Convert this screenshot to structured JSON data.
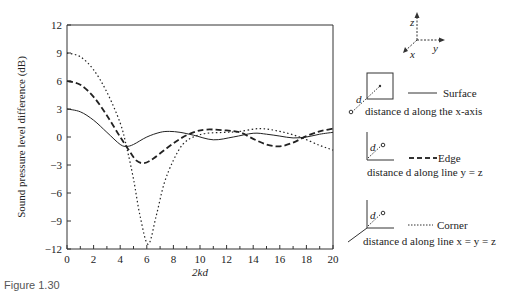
{
  "caption": "Figure 1.30",
  "axes": {
    "ylabel": "Sound pressure level difference (dB)",
    "xlabel": "2kd",
    "yticks": [
      "12",
      "9",
      "6",
      "3",
      "0",
      "−3",
      "−6",
      "−9",
      "−12"
    ],
    "xticks": [
      "0",
      "2",
      "4",
      "6",
      "8",
      "10",
      "12",
      "14",
      "16",
      "18",
      "20"
    ]
  },
  "legend": {
    "coord_labels": {
      "z": "z",
      "y": "y",
      "x": "x"
    },
    "items": [
      {
        "label": "Surface",
        "description": "distance d along the x-axis",
        "style": "solid"
      },
      {
        "label": "Edge",
        "description": "distance d along line y = z",
        "style": "dashed"
      },
      {
        "label": "Corner",
        "description": "distance d along line x = y = z",
        "style": "dotted"
      }
    ],
    "d_label": "d"
  },
  "chart_data": {
    "type": "line",
    "title": "",
    "xlabel": "2kd",
    "ylabel": "Sound pressure level difference (dB)",
    "xlim": [
      0,
      20
    ],
    "ylim": [
      -12,
      12
    ],
    "grid": false,
    "legend_position": "right",
    "series": [
      {
        "name": "Surface",
        "style": "solid",
        "x": [
          0,
          1,
          2,
          3,
          4,
          4.5,
          5,
          6,
          7,
          7.7,
          8.5,
          9.5,
          11,
          12.5,
          14,
          15,
          16,
          17,
          18,
          19,
          20
        ],
        "y": [
          3,
          2.7,
          1.8,
          0.5,
          -0.8,
          -1.0,
          -0.8,
          0.0,
          0.5,
          0.6,
          0.5,
          0.2,
          -0.3,
          0.0,
          0.4,
          0.3,
          0.1,
          -0.1,
          0.0,
          0.3,
          0.5
        ]
      },
      {
        "name": "Edge",
        "style": "dashed",
        "x": [
          0,
          1,
          2,
          3,
          4,
          4.6,
          5.2,
          5.8,
          6.5,
          7.5,
          8.5,
          9.5,
          10.5,
          12,
          13,
          14,
          15,
          16,
          17,
          18,
          19,
          20
        ],
        "y": [
          6,
          5.6,
          4.3,
          2.3,
          0.0,
          -1.3,
          -2.5,
          -2.8,
          -2.3,
          -1.2,
          -0.2,
          0.5,
          0.8,
          0.7,
          0.5,
          -0.2,
          -0.8,
          -1.0,
          -0.6,
          0.1,
          0.6,
          0.9
        ]
      },
      {
        "name": "Corner",
        "style": "dotted",
        "x": [
          0,
          1,
          2,
          3,
          4,
          4.5,
          5,
          5.5,
          6.1,
          6.7,
          7.3,
          8,
          8.7,
          9.5,
          10.5,
          12,
          13,
          14.5,
          16,
          17.5,
          19,
          20
        ],
        "y": [
          9,
          8.6,
          7.2,
          4.8,
          1.5,
          -1.2,
          -4.5,
          -8.5,
          -11.5,
          -8.5,
          -5.0,
          -2.5,
          -0.8,
          0.0,
          0.4,
          0.5,
          0.6,
          0.9,
          0.6,
          0.0,
          -0.9,
          -1.4
        ]
      }
    ]
  }
}
